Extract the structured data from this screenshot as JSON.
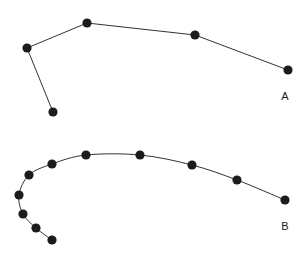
{
  "figure": {
    "background_color": "#ffffff",
    "width": 305,
    "height": 261,
    "ink_color": "#1c1c1c"
  },
  "chart_data": {
    "type": "scatter",
    "title": "",
    "subtitle": "",
    "xlabel": "",
    "ylabel": "",
    "xlim": [
      0,
      305
    ],
    "ylim": [
      261,
      0
    ],
    "grid": false,
    "axes_visible": false,
    "tick_labels": [],
    "legend": {
      "position": "inline-right",
      "entries": [
        "A",
        "B"
      ]
    },
    "annotations": [
      {
        "text": "A",
        "x": 285,
        "y": 97
      },
      {
        "text": "B",
        "x": 285,
        "y": 227
      }
    ],
    "series": [
      {
        "name": "A",
        "label": "A",
        "label_x": 285,
        "label_y": 97,
        "marker": "circle",
        "marker_size": 4.6,
        "color": "#1c1c1c",
        "line_style": "straight",
        "description": "Upper angular polyline with a downward branch on the left",
        "points": [
          {
            "x": 27,
            "y": 48
          },
          {
            "x": 87,
            "y": 23
          },
          {
            "x": 195,
            "y": 35
          },
          {
            "x": 288,
            "y": 70
          },
          {
            "x": 53,
            "y": 112
          }
        ],
        "segments": [
          {
            "from": 4,
            "to": 0
          },
          {
            "from": 0,
            "to": 1
          },
          {
            "from": 1,
            "to": 2
          },
          {
            "from": 2,
            "to": 3
          }
        ]
      },
      {
        "name": "B",
        "label": "B",
        "label_x": 285,
        "label_y": 227,
        "marker": "circle",
        "marker_size": 4.6,
        "color": "#1c1c1c",
        "line_style": "smooth",
        "description": "Lower smooth hooked arc curling back on the left and descending to the right",
        "points": [
          {
            "x": 52,
            "y": 240
          },
          {
            "x": 36,
            "y": 228
          },
          {
            "x": 23,
            "y": 214
          },
          {
            "x": 19,
            "y": 195
          },
          {
            "x": 29,
            "y": 175
          },
          {
            "x": 52,
            "y": 164
          },
          {
            "x": 86,
            "y": 155
          },
          {
            "x": 140,
            "y": 155
          },
          {
            "x": 192,
            "y": 165
          },
          {
            "x": 237,
            "y": 180
          },
          {
            "x": 285,
            "y": 200
          }
        ],
        "segments": [
          {
            "from": 0,
            "to": 1
          },
          {
            "from": 1,
            "to": 2
          },
          {
            "from": 2,
            "to": 3
          },
          {
            "from": 3,
            "to": 4
          },
          {
            "from": 4,
            "to": 5
          },
          {
            "from": 5,
            "to": 6
          },
          {
            "from": 6,
            "to": 7
          },
          {
            "from": 7,
            "to": 8
          },
          {
            "from": 8,
            "to": 9
          },
          {
            "from": 9,
            "to": 10
          }
        ]
      }
    ]
  }
}
